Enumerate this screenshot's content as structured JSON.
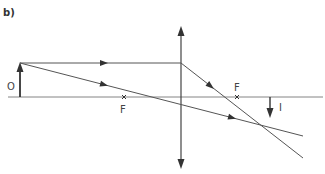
{
  "part_label": "b)",
  "labels": {
    "object": "O",
    "image": "I",
    "focal_left": "F",
    "focal_right": "F"
  },
  "colors": {
    "line": "#555555",
    "axis": "#666666",
    "background": "#ffffff"
  },
  "diagram": {
    "type": "ray diagram, converging lens",
    "optical_axis_y": 97,
    "lens_x": 181,
    "object": {
      "x": 20,
      "base_y": 97,
      "tip_y": 63
    },
    "image": {
      "x": 270,
      "base_y": 97,
      "tip_y": 117
    },
    "focal_points": [
      {
        "x": 124,
        "y": 97
      },
      {
        "x": 237,
        "y": 97
      }
    ]
  }
}
